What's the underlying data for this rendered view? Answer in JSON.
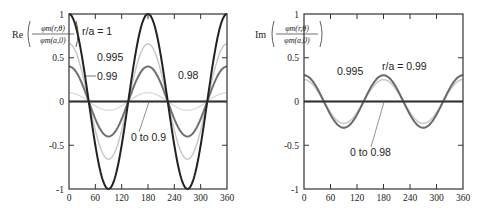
{
  "chart_data": [
    {
      "type": "line",
      "title": "",
      "ylabel": "Re(φm(r,θ)/φm(a,0))",
      "ylabel_prefix": "Re",
      "ylabel_num": "φm(r,θ)",
      "ylabel_den": "φm(a,0)",
      "xlabel": "",
      "xlim": [
        0,
        360
      ],
      "ylim": [
        -1,
        1
      ],
      "xticks": [
        "0",
        "60",
        "120",
        "180",
        "240",
        "300",
        "360"
      ],
      "yticks": [
        "1",
        "0.5",
        "0",
        "-0.5",
        "-1"
      ],
      "grid": false,
      "x": [
        0,
        30,
        60,
        90,
        120,
        150,
        180,
        210,
        240,
        270,
        300,
        330,
        360
      ],
      "series": [
        {
          "name": "r/a = 1",
          "color": "#222222",
          "width": 2,
          "amplitude": 1.0,
          "values": [
            1,
            0.5,
            -0.5,
            -1,
            -0.5,
            0.5,
            1,
            0.5,
            -0.5,
            -1,
            -0.5,
            0.5,
            1
          ]
        },
        {
          "name": "0.995",
          "color": "#c8c8c8",
          "width": 1.5,
          "amplitude": 0.66,
          "values": [
            0.66,
            0.33,
            -0.33,
            -0.66,
            -0.33,
            0.33,
            0.66,
            0.33,
            -0.33,
            -0.66,
            -0.33,
            0.33,
            0.66
          ]
        },
        {
          "name": "0.99",
          "color": "#707070",
          "width": 2,
          "amplitude": 0.4,
          "values": [
            0.4,
            0.2,
            -0.2,
            -0.4,
            -0.2,
            0.2,
            0.4,
            0.2,
            -0.2,
            -0.4,
            -0.2,
            0.2,
            0.4
          ]
        },
        {
          "name": "0.98",
          "color": "#d8d8d8",
          "width": 1.2,
          "amplitude": 0.1,
          "values": [
            0.1,
            0.05,
            -0.05,
            -0.1,
            -0.05,
            0.05,
            0.1,
            0.05,
            -0.05,
            -0.1,
            -0.05,
            0.05,
            0.1
          ]
        },
        {
          "name": "0 to 0.9",
          "color": "#555555",
          "width": 2,
          "amplitude": 0.0,
          "values": [
            0,
            0,
            0,
            0,
            0,
            0,
            0,
            0,
            0,
            0,
            0,
            0,
            0
          ]
        }
      ],
      "annotations": [
        "r/a = 1",
        "0.995",
        "0.99",
        "0.98",
        "0 to 0.9"
      ]
    },
    {
      "type": "line",
      "title": "",
      "ylabel": "Im(φm(r,θ)/φm(a,0))",
      "ylabel_prefix": "Im",
      "ylabel_num": "φm(r,θ)",
      "ylabel_den": "φm(a,0)",
      "xlabel": "",
      "xlim": [
        0,
        360
      ],
      "ylim": [
        -1,
        1
      ],
      "xticks": [
        "0",
        "60",
        "120",
        "180",
        "240",
        "300",
        "360"
      ],
      "yticks": [
        "1",
        "0.5",
        "0",
        "-0.5",
        "-1"
      ],
      "grid": false,
      "x": [
        0,
        30,
        60,
        90,
        120,
        150,
        180,
        210,
        240,
        270,
        300,
        330,
        360
      ],
      "series": [
        {
          "name": "r/a = 0.99",
          "color": "#6a6a6a",
          "width": 2,
          "amplitude": 0.3,
          "values": [
            0.3,
            0.15,
            -0.15,
            -0.3,
            -0.15,
            0.15,
            0.3,
            0.15,
            -0.15,
            -0.3,
            -0.15,
            0.15,
            0.3
          ]
        },
        {
          "name": "0.995",
          "color": "#c8c8c8",
          "width": 1.5,
          "amplitude": 0.25,
          "values": [
            0.25,
            0.125,
            -0.125,
            -0.25,
            -0.125,
            0.125,
            0.25,
            0.125,
            -0.125,
            -0.25,
            -0.125,
            0.125,
            0.25
          ]
        },
        {
          "name": "0 to 0.98",
          "color": "#555555",
          "width": 2,
          "amplitude": 0.0,
          "values": [
            0,
            0,
            0,
            0,
            0,
            0,
            0,
            0,
            0,
            0,
            0,
            0,
            0
          ]
        }
      ],
      "annotations": [
        "r/a = 0.99",
        "0.995",
        "0 to 0.98"
      ]
    }
  ],
  "left": {
    "label_ra1": "r/a = 1",
    "label_0995": "0.995",
    "label_099": "0.99",
    "label_098": "0.98",
    "label_0to09": "0 to 0.9"
  },
  "right": {
    "label_ra099": "r/a = 0.99",
    "label_0995": "0.995",
    "label_0to098": "0 to 0.98"
  }
}
